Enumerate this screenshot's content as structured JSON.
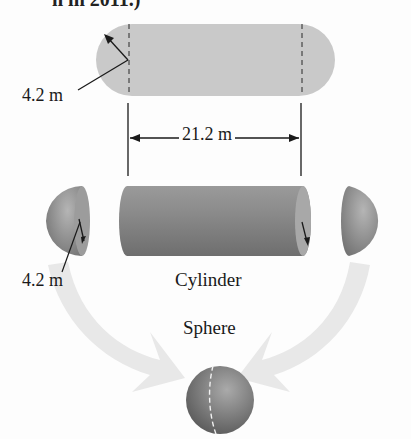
{
  "header": {
    "partial_text": "n in 2011.)"
  },
  "diagram": {
    "top_shape": {
      "description": "capsule (cylinder with hemispherical ends), top view",
      "radius_label": "4.2 m",
      "length_label": "21.2 m"
    },
    "exploded_view": {
      "left_hemisphere_radius_label": "4.2 m",
      "cylinder_label": "Cylinder"
    },
    "combined": {
      "sphere_label": "Sphere"
    },
    "colors": {
      "capsule_fill": "#c8c8c8",
      "solid_fill": "#8a8a8a",
      "arrow_fill": "#e6e6e6",
      "line": "#1a1a1a"
    }
  }
}
